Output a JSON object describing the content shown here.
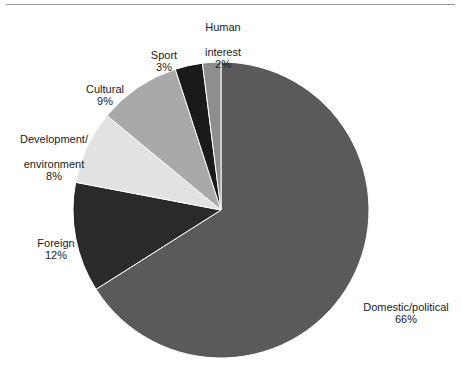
{
  "figure": {
    "name": "pie-chart-figure",
    "has_top_rule": true,
    "background_color": "#ffffff"
  },
  "chart_data": {
    "type": "pie",
    "title": "",
    "subtitle": "",
    "xlabel": "",
    "ylabel": "",
    "legend_position": "none",
    "grid": false,
    "label_format": "name on one or more lines, percentage below",
    "start_angle_deg": 0,
    "direction": "clockwise",
    "center": {
      "x": 221,
      "y": 210
    },
    "radius": 148,
    "categories": [
      "Domestic/political",
      "Foreign",
      "Development/environment",
      "Cultural",
      "Sport",
      "Human interest"
    ],
    "values": [
      66,
      12,
      8,
      9,
      3,
      2
    ],
    "units": "%",
    "total": 100,
    "slices": [
      {
        "name": "Domestic/political",
        "label_lines": [
          "Domestic/political"
        ],
        "value": 66,
        "value_text": "66%",
        "color": "#5a5a5a",
        "start_deg": 0,
        "end_deg": 237.6
      },
      {
        "name": "Foreign",
        "label_lines": [
          "Foreign"
        ],
        "value": 12,
        "value_text": "12%",
        "color": "#2a2a2a",
        "start_deg": 237.6,
        "end_deg": 280.8
      },
      {
        "name": "Development/environment",
        "label_lines": [
          "Development/",
          "environment"
        ],
        "value": 8,
        "value_text": "8%",
        "color": "#e2e2e2",
        "start_deg": 280.8,
        "end_deg": 309.6
      },
      {
        "name": "Cultural",
        "label_lines": [
          "Cultural"
        ],
        "value": 9,
        "value_text": "9%",
        "color": "#a9a9a9",
        "start_deg": 309.6,
        "end_deg": 342.0
      },
      {
        "name": "Sport",
        "label_lines": [
          "Sport"
        ],
        "value": 3,
        "value_text": "3%",
        "color": "#1a1a1a",
        "start_deg": 342.0,
        "end_deg": 352.8
      },
      {
        "name": "Human interest",
        "label_lines": [
          "Human",
          "interest"
        ],
        "value": 2,
        "value_text": "2%",
        "color": "#8e8e8e",
        "start_deg": 352.8,
        "end_deg": 360.0
      }
    ]
  },
  "labels": {
    "human_interest": {
      "line1": "Human",
      "line2": "interest",
      "pct": "2%"
    },
    "sport": {
      "line1": "Sport",
      "pct": "3%"
    },
    "cultural": {
      "line1": "Cultural",
      "pct": "9%"
    },
    "development": {
      "line1": "Development/",
      "line2": "environment",
      "pct": "8%"
    },
    "foreign": {
      "line1": "Foreign",
      "pct": "12%"
    },
    "domestic": {
      "line1": "Domestic/political",
      "pct": "66%"
    }
  }
}
